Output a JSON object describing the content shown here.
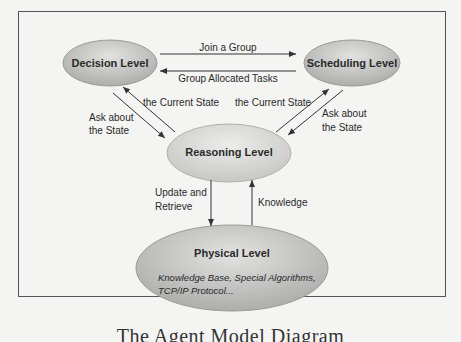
{
  "diagram": {
    "nodes": {
      "decision": {
        "title": "Decision Level"
      },
      "scheduling": {
        "title": "Scheduling Level"
      },
      "reasoning": {
        "title": "Reasoning Level"
      },
      "physical": {
        "title": "Physical Level",
        "subtitle_line1": "Knowledge Base, Special Algorithms,",
        "subtitle_line2": "TCP/IP Protocol..."
      }
    },
    "edges": {
      "join_group": "Join a Group",
      "group_tasks": "Group Allocated Tasks",
      "left_current_state": "the Current State",
      "left_ask_line1": "Ask about",
      "left_ask_line2": "the State",
      "right_current_state": "the Current State",
      "right_ask_line1": "Ask about",
      "right_ask_line2": "the State",
      "update_line1": "Update and",
      "update_line2": "Retrieve",
      "knowledge": "Knowledge"
    },
    "caption": "The Agent Model Diagram"
  },
  "colors": {
    "node_fill_top": "#d6d6d4",
    "node_fill_bottom": "#a9a9a7",
    "node_stroke": "#9a9a98",
    "line": "#333333",
    "frame": "#555555",
    "background": "#f4f4f3"
  }
}
